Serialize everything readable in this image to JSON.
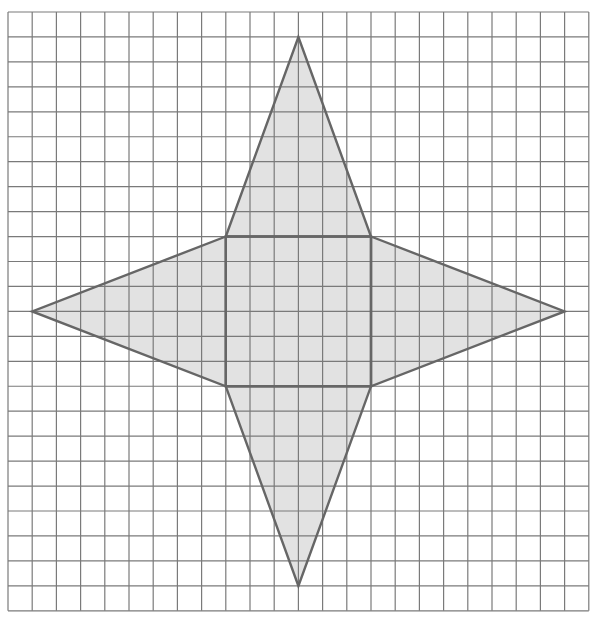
{
  "diagram": {
    "type": "net-of-square-pyramid",
    "grid": {
      "cols": 24,
      "rows": 24,
      "origin_px": [
        8,
        12
      ],
      "cell_w": 24.2,
      "cell_h": 24.95,
      "line_color": "#7a7a7a",
      "line_width": 1.2
    },
    "shape": {
      "fill": "#e2e2e2",
      "stroke": "#666666",
      "stroke_width": 2.4,
      "square": [
        [
          9,
          9
        ],
        [
          15,
          9
        ],
        [
          15,
          15
        ],
        [
          9,
          15
        ]
      ],
      "triangles": [
        {
          "name": "top",
          "points": [
            [
              9,
              9
            ],
            [
              12,
              1
            ],
            [
              15,
              9
            ]
          ]
        },
        {
          "name": "right",
          "points": [
            [
              15,
              9
            ],
            [
              23,
              12
            ],
            [
              15,
              15
            ]
          ]
        },
        {
          "name": "bottom",
          "points": [
            [
              9,
              15
            ],
            [
              12,
              23
            ],
            [
              15,
              15
            ]
          ]
        },
        {
          "name": "left",
          "points": [
            [
              9,
              9
            ],
            [
              1,
              12
            ],
            [
              9,
              15
            ]
          ]
        }
      ]
    }
  }
}
